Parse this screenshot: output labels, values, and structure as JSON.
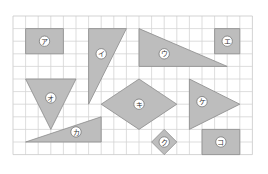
{
  "grid": {
    "origin_x": 13,
    "origin_y": 16,
    "cell": 12.6,
    "cols": 19,
    "rows": 11,
    "line_color": "#d4d4d4",
    "border_color": "#c8c8c8"
  },
  "style": {
    "shape_fill": "#bdbdbd",
    "shape_stroke": "#8a8a8a",
    "label_bg": "#ffffff",
    "label_border": "#777777",
    "label_color": "#333333"
  },
  "shapes": [
    {
      "id": "a",
      "label": "ア",
      "kind": "rectangle",
      "points": [
        [
          1,
          1
        ],
        [
          4,
          1
        ],
        [
          4,
          3
        ],
        [
          1,
          3
        ]
      ],
      "label_at": [
        2.5,
        2
      ]
    },
    {
      "id": "i",
      "label": "イ",
      "kind": "right-triangle",
      "points": [
        [
          6,
          1
        ],
        [
          9,
          1
        ],
        [
          6,
          7
        ]
      ],
      "label_at": [
        7,
        3
      ]
    },
    {
      "id": "u",
      "label": "ウ",
      "kind": "right-triangle",
      "points": [
        [
          10,
          1
        ],
        [
          10,
          4
        ],
        [
          17,
          4
        ]
      ],
      "label_at": [
        12,
        3
      ]
    },
    {
      "id": "e",
      "label": "エ",
      "kind": "square",
      "points": [
        [
          16,
          1
        ],
        [
          18,
          1
        ],
        [
          18,
          3
        ],
        [
          16,
          3
        ]
      ],
      "label_at": [
        17,
        2
      ]
    },
    {
      "id": "o",
      "label": "オ",
      "kind": "triangle",
      "points": [
        [
          1,
          5
        ],
        [
          5,
          5
        ],
        [
          3,
          9
        ]
      ],
      "label_at": [
        3,
        6.5
      ]
    },
    {
      "id": "ka",
      "label": "カ",
      "kind": "right-triangle",
      "points": [
        [
          1,
          10
        ],
        [
          7,
          8
        ],
        [
          7,
          10
        ]
      ],
      "label_at": [
        5,
        9.2
      ]
    },
    {
      "id": "ki",
      "label": "キ",
      "kind": "rhombus",
      "points": [
        [
          7,
          7
        ],
        [
          10,
          5
        ],
        [
          13,
          7
        ],
        [
          10,
          9
        ]
      ],
      "label_at": [
        10,
        7
      ]
    },
    {
      "id": "ku",
      "label": "ク",
      "kind": "square-rotated",
      "points": [
        [
          12,
          9
        ],
        [
          13,
          10
        ],
        [
          12,
          11
        ],
        [
          11,
          10
        ]
      ],
      "label_at": [
        12,
        10
      ]
    },
    {
      "id": "ke",
      "label": "ケ",
      "kind": "triangle",
      "points": [
        [
          14,
          5
        ],
        [
          14,
          9
        ],
        [
          18,
          7
        ]
      ],
      "label_at": [
        15,
        6.8
      ]
    },
    {
      "id": "ko",
      "label": "コ",
      "kind": "rectangle",
      "points": [
        [
          15,
          9
        ],
        [
          18,
          9
        ],
        [
          18,
          11
        ],
        [
          15,
          11
        ]
      ],
      "label_at": [
        16.5,
        10
      ]
    }
  ]
}
